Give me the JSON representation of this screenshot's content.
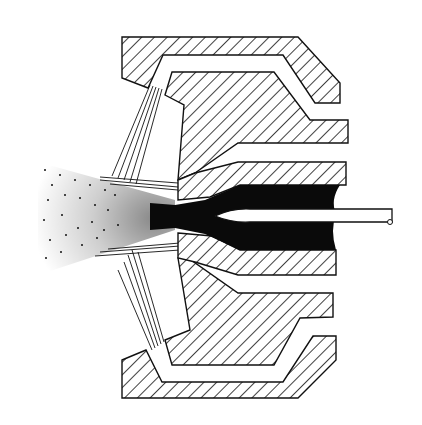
{
  "figure": {
    "type": "cross-section technical drawing",
    "colors": {
      "background": "#ffffff",
      "ink": "#111111",
      "fluid": "#0a0a0a"
    },
    "parts": [
      {
        "id": "air-cap",
        "label": ""
      },
      {
        "id": "fluid-nozzle",
        "label": ""
      },
      {
        "id": "needle",
        "label": ""
      },
      {
        "id": "fluid",
        "label": ""
      },
      {
        "id": "air-jets",
        "label": ""
      },
      {
        "id": "spray-cloud",
        "label": ""
      }
    ],
    "caption": ""
  }
}
